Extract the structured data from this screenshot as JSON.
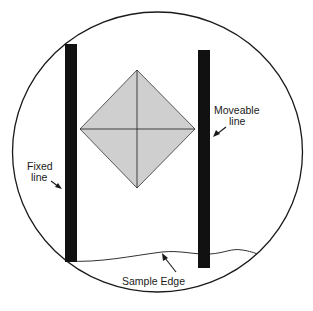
{
  "diagram": {
    "labels": {
      "fixed_line_1": "Fixed",
      "fixed_line_2": "line",
      "moveable_line_1": "Moveable",
      "moveable_line_2": "line",
      "sample_edge": "Sample Edge"
    },
    "colors": {
      "outline": "#1a1a1a",
      "bar": "#111111",
      "indent_fill": "#cfcfcf",
      "background": "#ffffff"
    },
    "elements": {
      "field_of_view": {
        "shape": "circle",
        "cx": 157.5,
        "cy": 152,
        "rx": 145,
        "ry": 140
      },
      "fixed_bar": {
        "x": 65,
        "y": 44,
        "width": 12,
        "height": 218
      },
      "moveable_bar": {
        "x": 198,
        "y": 50,
        "width": 12,
        "height": 218
      },
      "indentation": {
        "shape": "diamond",
        "top": [
          137,
          70
        ],
        "right": [
          195,
          129
        ],
        "bottom": [
          137,
          188
        ],
        "left": [
          80,
          129
        ]
      }
    }
  }
}
